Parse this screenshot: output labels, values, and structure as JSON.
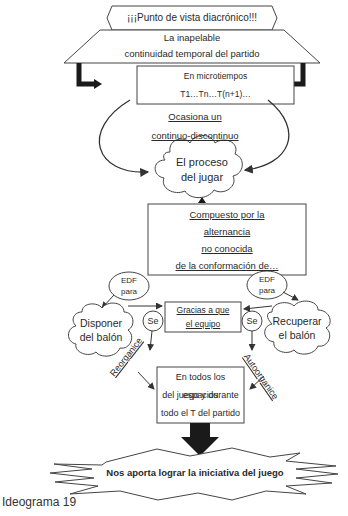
{
  "diagram": {
    "title_banner": "¡¡¡Punto de vista diacrónico!!!",
    "trapezoid": {
      "line1": "La inapelable",
      "line2": "continuidad temporal del partido"
    },
    "microtiempos": {
      "line1": "En microtiempos",
      "line2": "T1…Tn…T(n+1)…"
    },
    "ocasiona": {
      "line1": "Ocasiona un",
      "line2": "continuo-discontinuo"
    },
    "cloud_center": {
      "line1": "El proceso",
      "line2": "del jugar"
    },
    "compuesto": {
      "line1": "Compuesto por la",
      "line2": "alternancia",
      "line3": "no conocida",
      "line4": "de la conformación de…"
    },
    "edf_left": {
      "line1": "EDF",
      "line2": "para"
    },
    "edf_right": {
      "line1": "EDF",
      "line2": "para"
    },
    "cloud_left": {
      "line1": "Disponer",
      "line2": "del balón"
    },
    "cloud_right": {
      "line1": "Recuperar",
      "line2": "el balón"
    },
    "gracias": {
      "line1": "Gracias a que",
      "line2": "el equipo"
    },
    "se_left": "Se",
    "se_right": "Se",
    "reorganice": "Reorganice",
    "autoorganice": "Autoorganice",
    "espacios": {
      "line1": "En todos los espacios",
      "line2": "del juego y durante",
      "line3": "todo el T del partido"
    },
    "result": "Nos aporta lograr la iniciativa del juego",
    "caption": "Ideograma 19"
  },
  "colors": {
    "line": "#444444",
    "arrow_fill": "#1a1a1a",
    "background": "#ffffff"
  }
}
